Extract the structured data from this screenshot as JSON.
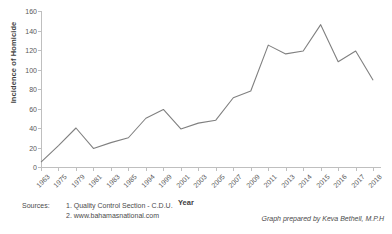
{
  "chart_data": {
    "type": "line",
    "title": "",
    "xlabel": "Year",
    "ylabel": "Incidence of Homicide",
    "categories": [
      "1963",
      "1975",
      "1979",
      "1981",
      "1983",
      "1985",
      "1994",
      "1999",
      "2001",
      "2003",
      "2005",
      "2007",
      "2009",
      "2011",
      "2013",
      "2014",
      "2015",
      "2016",
      "2017",
      "2018"
    ],
    "values": [
      5,
      22,
      40,
      19,
      25,
      30,
      50,
      59,
      39,
      45,
      48,
      71,
      78,
      125,
      116,
      119,
      146,
      108,
      119,
      89
    ],
    "series": [
      {
        "name": "Incidence of Homicide",
        "values": [
          5,
          22,
          40,
          19,
          25,
          30,
          50,
          59,
          39,
          45,
          48,
          71,
          78,
          125,
          116,
          119,
          146,
          108,
          119,
          89
        ],
        "color": "#808080"
      }
    ],
    "ylim": [
      0,
      160
    ],
    "yticks": [
      0,
      20,
      40,
      60,
      80,
      100,
      120,
      140,
      160
    ],
    "grid": false,
    "legend": false,
    "legend_position": "none",
    "line_color": "#808080"
  },
  "footer": {
    "sources_label": "Sources:",
    "source_1": "1. Quality Control Section - C.D.U.",
    "source_2": "2. www.bahamasnational.com",
    "credit": "Graph prepared by Keva Bethell, M.P.H"
  }
}
